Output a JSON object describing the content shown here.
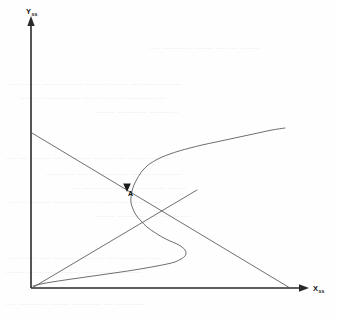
{
  "figure": {
    "kind": "steady-state-phase-plot",
    "background_color": "#fefefe",
    "axis_color": "#2a2a2a",
    "curve_color": "#55555a",
    "label_color": "#111111"
  },
  "axes": {
    "y": {
      "symbol": "Y",
      "subscript": "ss",
      "label_full": "Yss",
      "origin_px": [
        31,
        288
      ],
      "tip_px": [
        31,
        20
      ],
      "has_arrow": true
    },
    "x": {
      "symbol": "X",
      "subscript": "ss",
      "label_full": "Xss",
      "origin_px": [
        31,
        288
      ],
      "tip_px": [
        307,
        288
      ],
      "has_arrow": true
    }
  },
  "annotations": {
    "point_a": {
      "label": "A",
      "label_px": [
        128,
        196
      ],
      "marker_px": [
        127,
        188
      ],
      "marker_type": "arrowhead"
    }
  },
  "chart_data": {
    "type": "line",
    "title": "",
    "xlabel": "Xss",
    "ylabel": "Yss",
    "grid": false,
    "legend": null,
    "xlim": [
      0,
      1
    ],
    "ylim": [
      0,
      1
    ],
    "annotations": [
      {
        "text": "A",
        "x": 0.35,
        "y": 0.37,
        "marker": "arrowhead"
      }
    ],
    "series": [
      {
        "name": "s-shaped-steady-state-curve",
        "type": "line",
        "comment": "Sigmoidal / cubic-like curve, folded, with upper branch rising to the right and a lower fold bending back left.",
        "points_px": [
          [
            285,
            128
          ],
          [
            272,
            130
          ],
          [
            258,
            133
          ],
          [
            244,
            136
          ],
          [
            230,
            139
          ],
          [
            216,
            142
          ],
          [
            202,
            145
          ],
          [
            190,
            148
          ],
          [
            179,
            151
          ],
          [
            170,
            154
          ],
          [
            162,
            157
          ],
          [
            156,
            160
          ],
          [
            151,
            163
          ],
          [
            147,
            166
          ],
          [
            143,
            170
          ],
          [
            140,
            174
          ],
          [
            137,
            179
          ],
          [
            134,
            185
          ],
          [
            132,
            191
          ],
          [
            131,
            197
          ],
          [
            131,
            203
          ],
          [
            133,
            209
          ],
          [
            136,
            215
          ],
          [
            141,
            221
          ],
          [
            147,
            227
          ],
          [
            154,
            232
          ],
          [
            162,
            237
          ],
          [
            170,
            241
          ],
          [
            177,
            244
          ],
          [
            182,
            247
          ],
          [
            185,
            250
          ],
          [
            186,
            253
          ],
          [
            185,
            256
          ],
          [
            181,
            259
          ],
          [
            175,
            262
          ],
          [
            167,
            264
          ],
          [
            157,
            266
          ],
          [
            146,
            268
          ],
          [
            134,
            270
          ],
          [
            121,
            272
          ],
          [
            107,
            274
          ],
          [
            93,
            276
          ],
          [
            79,
            278
          ],
          [
            65,
            280
          ],
          [
            52,
            282
          ],
          [
            41,
            284
          ],
          [
            33,
            286
          ]
        ]
      },
      {
        "name": "descending-straight-line",
        "type": "line",
        "comment": "Straight line from the Y-axis down to the X-axis tip, crossing the S-curve at point A.",
        "points_px": [
          [
            32,
            133
          ],
          [
            290,
            288
          ]
        ]
      },
      {
        "name": "rising-line-from-origin",
        "type": "line",
        "comment": "Straight line rising from the origin to the upper right, tangent region near the lower fold.",
        "points_px": [
          [
            32,
            288
          ],
          [
            197,
            190
          ]
        ]
      }
    ]
  },
  "ghost_text": {
    "visible": true,
    "note": "Faint show-through of text printed on the reverse side of the page; illegible.",
    "lines": [
      {
        "x": 150,
        "y": 42,
        "text": "— ———  —— — — ——"
      },
      {
        "x": 8,
        "y": 78,
        "text": "— —— ——— — —— —— — ————"
      },
      {
        "x": 20,
        "y": 92,
        "text": "—— ———— —— —— ————"
      },
      {
        "x": 96,
        "y": 106,
        "text": "—— ——— ———"
      },
      {
        "x": 6,
        "y": 152,
        "text": "— — —— ———— —— — —— ——"
      },
      {
        "x": 46,
        "y": 168,
        "text": "——— — ———— —— ———"
      },
      {
        "x": 70,
        "y": 182,
        "text": "— ——— —— ——— ——"
      },
      {
        "x": 6,
        "y": 196,
        "text": "— — —— ——— — —— ——— —"
      },
      {
        "x": 96,
        "y": 210,
        "text": "—— ——— — ———"
      },
      {
        "x": 6,
        "y": 252,
        "text": "— —— — ——— —— — ——— —"
      },
      {
        "x": 6,
        "y": 266,
        "text": "—— ——— —— ———— ——"
      },
      {
        "x": 6,
        "y": 298,
        "text": "— ——— —— ——— — ———"
      }
    ]
  }
}
